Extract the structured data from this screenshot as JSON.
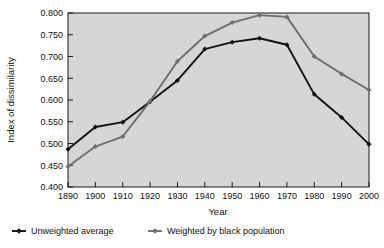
{
  "chart_data": {
    "type": "line",
    "title": "",
    "xlabel": "Year",
    "ylabel": "Index of dissimilarity",
    "x": [
      1890,
      1900,
      1910,
      1920,
      1930,
      1940,
      1950,
      1960,
      1970,
      1980,
      1990,
      2000
    ],
    "xticklabels": [
      "1890",
      "1900",
      "1910",
      "1920",
      "1930",
      "1940",
      "1950",
      "1960",
      "1970",
      "1980",
      "1990",
      "2000"
    ],
    "yticklabels": [
      "0.400",
      "0.450",
      "0.500",
      "0.550",
      "0.600",
      "0.650",
      "0.700",
      "0.750",
      "0.800"
    ],
    "yticks": [
      0.4,
      0.45,
      0.5,
      0.55,
      0.6,
      0.65,
      0.7,
      0.75,
      0.8
    ],
    "xlim": [
      1885,
      2005
    ],
    "ylim": [
      0.4,
      0.8
    ],
    "grid": false,
    "legend_position": "below",
    "series": [
      {
        "name": "Unweighted average",
        "color": "#121212",
        "marker": "diamond",
        "values": [
          0.487,
          0.538,
          0.549,
          0.596,
          0.645,
          0.717,
          0.733,
          0.742,
          0.727,
          0.613,
          0.56,
          0.498
        ]
      },
      {
        "name": "Weighted by black population",
        "color": "#6e6e6e",
        "marker": "diamond",
        "values": [
          0.447,
          0.493,
          0.516,
          0.597,
          0.689,
          0.747,
          0.778,
          0.795,
          0.791,
          0.7,
          0.66,
          0.623
        ]
      }
    ]
  },
  "legend": {
    "items": [
      {
        "label": "Unweighted average",
        "color": "#121212"
      },
      {
        "label": "Weighted by black population",
        "color": "#6e6e6e"
      }
    ]
  },
  "colors": {
    "plot_background": "#d6d6d6",
    "page_background": "#ffffff",
    "axis": "#1a1a1a",
    "series_a": "#121212",
    "series_b": "#6e6e6e"
  }
}
